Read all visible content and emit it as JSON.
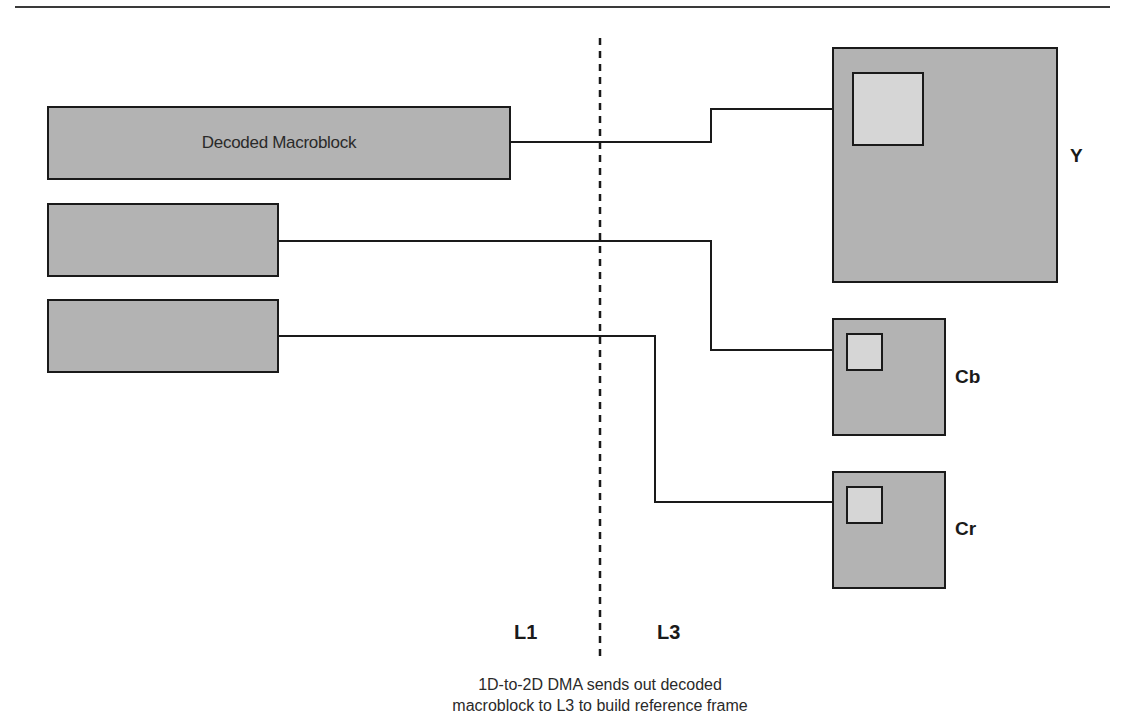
{
  "diagram": {
    "source_blocks": [
      {
        "id": "decoded-macroblock",
        "label": "Decoded Macroblock"
      },
      {
        "id": "cb-source",
        "label": ""
      },
      {
        "id": "cr-source",
        "label": ""
      }
    ],
    "frames": [
      {
        "id": "y",
        "label": "Y"
      },
      {
        "id": "cb",
        "label": "Cb"
      },
      {
        "id": "cr",
        "label": "Cr"
      }
    ],
    "levels": {
      "left": "L1",
      "right": "L3"
    },
    "caption": {
      "line1": "1D-to-2D DMA sends out decoded",
      "line2": "macroblock to L3 to build reference frame"
    },
    "colors": {
      "block_fill": "#b3b3b3",
      "inner_fill": "#d6d6d6",
      "stroke": "#1a1a1a"
    }
  }
}
